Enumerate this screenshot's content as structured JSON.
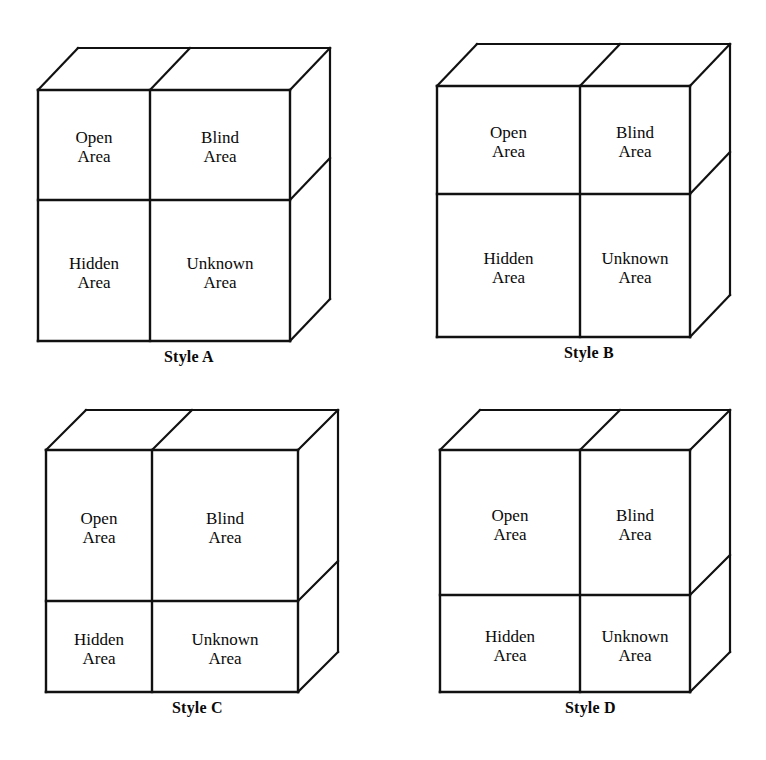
{
  "figure": {
    "quadrant_labels": {
      "open": {
        "line1": "Open",
        "line2": "Area"
      },
      "blind": {
        "line1": "Blind",
        "line2": "Area"
      },
      "hidden": {
        "line1": "Hidden",
        "line2": "Area"
      },
      "unknown": {
        "line1": "Unknown",
        "line2": "Area"
      }
    },
    "line_color": "#111111",
    "face_color": "#ffffff",
    "text_color": "#0a0a0a"
  },
  "panels": [
    {
      "id": "style-a",
      "caption": "Style A",
      "panel": {
        "left": 0,
        "top": 0,
        "width": 383,
        "height": 380
      },
      "geometry": {
        "front_left": 38,
        "front_right": 290,
        "front_top": 90,
        "front_bottom": 341,
        "depth_x": 40,
        "depth_y": 42,
        "v_divider": 150,
        "h_divider": 200
      },
      "caption_pos": {
        "x": 164,
        "top": 348
      }
    },
    {
      "id": "style-b",
      "caption": "Style B",
      "panel": {
        "left": 383,
        "top": 0,
        "width": 383,
        "height": 380
      },
      "geometry": {
        "front_left": 54,
        "front_right": 307,
        "front_top": 86,
        "front_bottom": 337,
        "depth_x": 40,
        "depth_y": 42,
        "v_divider": 197,
        "h_divider": 194
      },
      "caption_pos": {
        "x": 181,
        "top": 344
      }
    },
    {
      "id": "style-c",
      "caption": "Style C",
      "panel": {
        "left": 0,
        "top": 380,
        "width": 383,
        "height": 380
      },
      "geometry": {
        "front_left": 46,
        "front_right": 298,
        "front_top": 70,
        "front_bottom": 312,
        "depth_x": 40,
        "depth_y": 40,
        "v_divider": 152,
        "h_divider": 221
      },
      "caption_pos": {
        "x": 172,
        "top": 319
      }
    },
    {
      "id": "style-d",
      "caption": "Style D",
      "panel": {
        "left": 383,
        "top": 380,
        "width": 383,
        "height": 380
      },
      "geometry": {
        "front_left": 57,
        "front_right": 307,
        "front_top": 70,
        "front_bottom": 312,
        "depth_x": 40,
        "depth_y": 40,
        "v_divider": 197,
        "h_divider": 215
      },
      "caption_pos": {
        "x": 182,
        "top": 319
      }
    }
  ]
}
